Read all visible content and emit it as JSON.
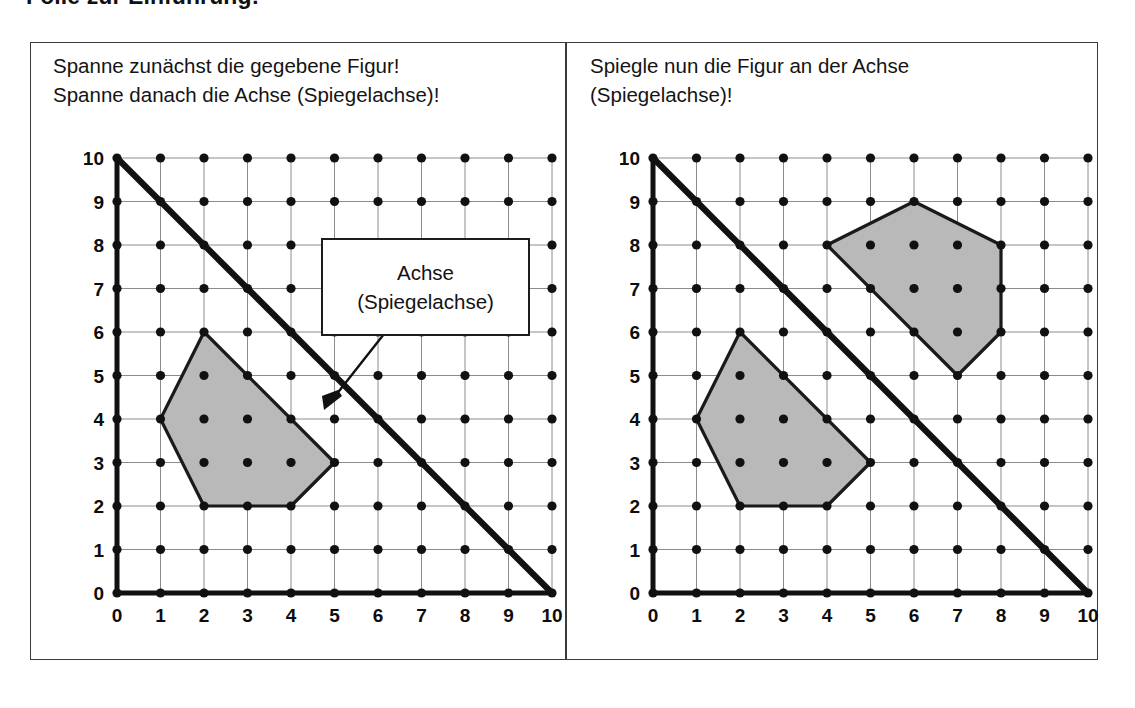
{
  "title": "Folie zur Einführung:",
  "colors": {
    "frame": "#3b3b3b",
    "grid_line": "#8c8c8c",
    "dot": "#111111",
    "axis": "#111111",
    "mirror_line": "#111111",
    "figure_fill": "#b9b9b9",
    "figure_stroke": "#1a1a1a",
    "text": "#141414",
    "background": "#ffffff"
  },
  "panels": [
    {
      "id": "left",
      "instruction": "Spanne zunächst die gegebene Figur!\nSpanne danach die Achse (Spiegelachse)!",
      "callout": {
        "line1": "Achse",
        "line2": "(Spiegelachse)",
        "arrow": "arrow-pointing-to-mirror-line"
      }
    },
    {
      "id": "right",
      "instruction": "Spiegle nun die Figur an der Achse\n(Spiegelachse)!"
    }
  ],
  "chart_data": {
    "type": "scatter",
    "title": "Folie zur Einführung:",
    "xlabel": "",
    "ylabel": "",
    "xlim": [
      0,
      10
    ],
    "ylim": [
      0,
      10
    ],
    "grid": true,
    "x_ticks": [
      0,
      1,
      2,
      3,
      4,
      5,
      6,
      7,
      8,
      9,
      10
    ],
    "y_ticks": [
      0,
      1,
      2,
      3,
      4,
      5,
      6,
      7,
      8,
      9,
      10
    ],
    "lattice_dots": "every integer point 0..10 x 0..10",
    "plots": [
      {
        "panel": "left",
        "mirror_line": {
          "label": "Achse (Spiegelachse)",
          "from": [
            0,
            10
          ],
          "to": [
            10,
            0
          ],
          "equation": "y = 10 - x"
        },
        "figures": [
          {
            "name": "original-figure",
            "vertices": [
              [
                1,
                4
              ],
              [
                2,
                6
              ],
              [
                5,
                3
              ],
              [
                4,
                2
              ],
              [
                2,
                2
              ]
            ],
            "fill": "#b9b9b9"
          }
        ]
      },
      {
        "panel": "right",
        "mirror_line": {
          "label": "Achse (Spiegelachse)",
          "from": [
            0,
            10
          ],
          "to": [
            10,
            0
          ],
          "equation": "y = 10 - x"
        },
        "figures": [
          {
            "name": "original-figure",
            "vertices": [
              [
                1,
                4
              ],
              [
                2,
                6
              ],
              [
                5,
                3
              ],
              [
                4,
                2
              ],
              [
                2,
                2
              ]
            ],
            "fill": "#b9b9b9"
          },
          {
            "name": "mirrored-figure",
            "vertices": [
              [
                6,
                9
              ],
              [
                4,
                8
              ],
              [
                7,
                5
              ],
              [
                8,
                6
              ],
              [
                8,
                8
              ]
            ],
            "fill": "#b9b9b9"
          }
        ]
      }
    ]
  }
}
